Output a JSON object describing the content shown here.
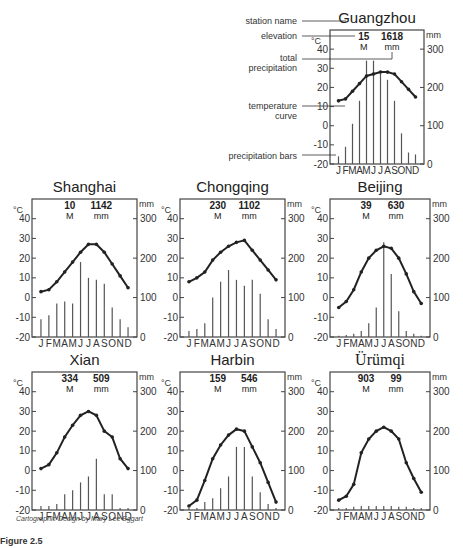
{
  "legend_labels": {
    "station_name": "station name",
    "elevation": "elevation",
    "total_precipitation_1": "total",
    "total_precipitation_2": "precipitation",
    "temperature_curve_1": "temperature",
    "temperature_curve_2": "curve",
    "precipitation_bars": "precipitation bars"
  },
  "axis": {
    "left_unit": "°C",
    "right_unit": "mm",
    "left_ticks": [
      40,
      30,
      20,
      10,
      0,
      -10,
      -20
    ],
    "right_ticks": [
      300,
      200,
      100,
      0
    ],
    "months": "J F M A M J J A S O N D",
    "elev_unit": "M",
    "precip_unit": "mm"
  },
  "credit": "Cartographic Design by Mary Lee Eggart",
  "caption": "Figure 2.5",
  "chart_data": [
    {
      "type": "bar+line",
      "title": "Guangzhou",
      "elevation_m": 15,
      "total_precip_mm": 1618,
      "months": [
        "J",
        "F",
        "M",
        "A",
        "M",
        "J",
        "J",
        "A",
        "S",
        "O",
        "N",
        "D"
      ],
      "temperature_c": [
        13,
        14,
        18,
        22,
        26,
        27,
        28,
        28,
        27,
        23,
        19,
        15
      ],
      "precip_mm": [
        20,
        45,
        105,
        165,
        270,
        270,
        235,
        220,
        165,
        80,
        30,
        25
      ],
      "ylim_temp": [
        -20,
        50
      ],
      "ylim_precip": [
        0,
        350
      ]
    },
    {
      "type": "bar+line",
      "title": "Shanghai",
      "elevation_m": 10,
      "total_precip_mm": 1142,
      "months": [
        "J",
        "F",
        "M",
        "A",
        "M",
        "J",
        "J",
        "A",
        "S",
        "O",
        "N",
        "D"
      ],
      "temperature_c": [
        3,
        4,
        8,
        13,
        18,
        23,
        27,
        27,
        23,
        17,
        11,
        5
      ],
      "precip_mm": [
        45,
        55,
        85,
        90,
        85,
        190,
        150,
        145,
        135,
        75,
        45,
        25
      ],
      "ylim_temp": [
        -20,
        50
      ],
      "ylim_precip": [
        0,
        350
      ]
    },
    {
      "type": "bar+line",
      "title": "Chongqing",
      "elevation_m": 230,
      "total_precip_mm": 1102,
      "months": [
        "J",
        "F",
        "M",
        "A",
        "M",
        "J",
        "J",
        "A",
        "S",
        "O",
        "N",
        "D"
      ],
      "temperature_c": [
        8,
        10,
        13,
        19,
        23,
        26,
        28,
        29,
        24,
        19,
        14,
        9
      ],
      "precip_mm": [
        15,
        20,
        35,
        100,
        140,
        170,
        145,
        130,
        145,
        110,
        45,
        20
      ],
      "ylim_temp": [
        -20,
        50
      ],
      "ylim_precip": [
        0,
        350
      ]
    },
    {
      "type": "bar+line",
      "title": "Beijing",
      "elevation_m": 39,
      "total_precip_mm": 630,
      "months": [
        "J",
        "F",
        "M",
        "A",
        "M",
        "J",
        "J",
        "A",
        "S",
        "O",
        "N",
        "D"
      ],
      "temperature_c": [
        -5,
        -2,
        4,
        13,
        20,
        24,
        26,
        25,
        20,
        12,
        3,
        -3
      ],
      "precip_mm": [
        3,
        5,
        8,
        15,
        35,
        75,
        240,
        160,
        65,
        15,
        8,
        3
      ],
      "ylim_temp": [
        -20,
        50
      ],
      "ylim_precip": [
        0,
        350
      ]
    },
    {
      "type": "bar+line",
      "title": "Xian",
      "elevation_m": 334,
      "total_precip_mm": 509,
      "months": [
        "J",
        "F",
        "M",
        "A",
        "M",
        "J",
        "J",
        "A",
        "S",
        "O",
        "N",
        "D"
      ],
      "temperature_c": [
        1,
        3,
        9,
        17,
        23,
        28,
        30,
        28,
        20,
        17,
        6,
        1
      ],
      "precip_mm": [
        10,
        10,
        15,
        40,
        50,
        70,
        85,
        130,
        40,
        40,
        5,
        5
      ],
      "ylim_temp": [
        -20,
        50
      ],
      "ylim_precip": [
        0,
        350
      ]
    },
    {
      "type": "bar+line",
      "title": "Harbin",
      "elevation_m": 159,
      "total_precip_mm": 546,
      "months": [
        "J",
        "F",
        "M",
        "A",
        "M",
        "J",
        "J",
        "A",
        "S",
        "O",
        "N",
        "D"
      ],
      "temperature_c": [
        -18,
        -15,
        -5,
        6,
        13,
        18,
        21,
        20,
        12,
        4,
        -6,
        -16
      ],
      "precip_mm": [
        5,
        5,
        20,
        30,
        55,
        85,
        160,
        160,
        85,
        45,
        15,
        5
      ],
      "ylim_temp": [
        -20,
        50
      ],
      "ylim_precip": [
        0,
        350
      ]
    },
    {
      "type": "bar+line",
      "title": "Ürümqi",
      "elevation_m": 903,
      "total_precip_mm": 99,
      "months": [
        "J",
        "F",
        "M",
        "A",
        "M",
        "J",
        "J",
        "A",
        "S",
        "O",
        "N",
        "D"
      ],
      "temperature_c": [
        -15,
        -13,
        -7,
        9,
        16,
        20,
        22,
        20,
        16,
        4,
        -4,
        -11
      ],
      "precip_mm": [
        5,
        5,
        8,
        10,
        10,
        10,
        10,
        10,
        8,
        8,
        5,
        5
      ],
      "ylim_temp": [
        -20,
        50
      ],
      "ylim_precip": [
        0,
        350
      ]
    }
  ]
}
